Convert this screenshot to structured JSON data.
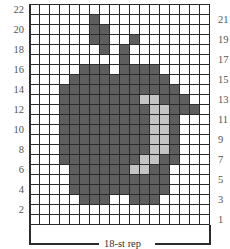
{
  "chart_data": {
    "type": "heatmap",
    "columns": 18,
    "rows": 22,
    "left_row_labels": [
      "22",
      "20",
      "18",
      "16",
      "14",
      "12",
      "10",
      "8",
      "6",
      "4",
      "2"
    ],
    "right_row_labels": [
      "21",
      "19",
      "17",
      "15",
      "13",
      "11",
      "9",
      "7",
      "5",
      "3",
      "1"
    ],
    "repeat_label": "18-st rep",
    "legend": {
      "d": "dark grey (apple body)",
      "l": "light grey (highlight)",
      ".": "white (background)"
    },
    "colors": {
      "background": "#ffffff",
      "dark": "#5e5e5e",
      "light": "#c4c4c4",
      "grid": "#2b2b2b"
    },
    "grid_rows_top_to_bottom": [
      "..................",
      "......d...........",
      "......dd..........",
      "......dd..d.......",
      ".......d.d........",
      ".........d........",
      ".....ddd.dddd.....",
      "....dddddddddd....",
      "...dddddddddddd...",
      "...ddddddddllddd..",
      "...dddddddddllddd.",
      "...dddddddddlld...",
      "...dddddddddlld...",
      "...dddddddddlld...",
      "...dddddddddlld...",
      "...ddddddddlldd...",
      "....ddddddlldd....",
      "....dddddddddd....",
      "....dddddddddd....",
      ".....ddd..ddd.....",
      "..................",
      ".................."
    ]
  }
}
